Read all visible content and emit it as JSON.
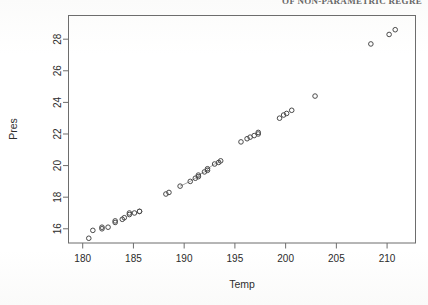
{
  "page": {
    "header_text": "OF NON-PARAMETRIC REGRE"
  },
  "figure": {
    "background_color": "#ffffff",
    "frame_color": "#6d6d6d",
    "point_color": "#4a4a4a",
    "line_color": "#7a7a7a"
  },
  "chart_data": {
    "type": "scatter",
    "title": "",
    "xlabel": "Temp",
    "ylabel": "Pres",
    "xlim": [
      178.6,
      212.8
    ],
    "ylim": [
      15.1,
      29.5
    ],
    "xticks": [
      180,
      185,
      190,
      195,
      200,
      205,
      210
    ],
    "yticks": [
      16,
      18,
      20,
      22,
      24,
      26,
      28
    ],
    "xtick_labels": [
      "180",
      "185",
      "190",
      "195",
      "200",
      "205",
      "210"
    ],
    "ytick_labels": [
      "16",
      "18",
      "20",
      "22",
      "24",
      "26",
      "28"
    ],
    "grid": false,
    "legend": null,
    "marker": "open-circle",
    "marker_size": 4.6,
    "x": [
      180.6,
      181.0,
      181.9,
      181.9,
      182.5,
      183.2,
      183.2,
      183.9,
      184.1,
      184.6,
      184.6,
      185.1,
      185.6,
      185.6,
      188.2,
      188.5,
      189.6,
      190.6,
      191.1,
      191.4,
      191.4,
      192.0,
      192.3,
      192.3,
      193.0,
      193.4,
      193.6,
      195.6,
      196.2,
      196.5,
      196.9,
      197.3,
      197.3,
      199.4,
      199.8,
      200.1,
      200.6,
      202.9,
      208.4,
      210.2,
      210.8
    ],
    "y": [
      15.4,
      15.9,
      16.0,
      16.1,
      16.1,
      16.4,
      16.5,
      16.6,
      16.7,
      16.9,
      17.0,
      17.0,
      17.1,
      17.1,
      18.2,
      18.3,
      18.7,
      19.0,
      19.2,
      19.3,
      19.4,
      19.6,
      19.7,
      19.8,
      20.1,
      20.2,
      20.3,
      21.5,
      21.7,
      21.8,
      21.9,
      22.0,
      22.1,
      23.0,
      23.2,
      23.3,
      23.5,
      24.4,
      27.7,
      28.3,
      28.6
    ],
    "connected_segment": {
      "note": "faint line drawn through the mid-range points",
      "x": [
        189.6,
        190.6,
        191.1,
        191.4,
        191.4,
        192.0,
        192.3,
        192.3,
        193.0,
        193.4,
        193.6
      ],
      "y": [
        18.7,
        19.0,
        19.2,
        19.3,
        19.4,
        19.6,
        19.7,
        19.8,
        20.1,
        20.2,
        20.3
      ]
    }
  }
}
